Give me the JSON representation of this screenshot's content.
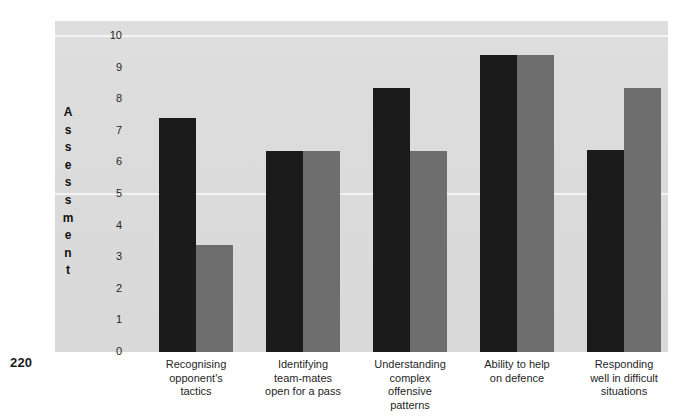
{
  "page": {
    "number": "220"
  },
  "chart_data": {
    "type": "bar",
    "title": "",
    "subtitle": "",
    "xlabel": "",
    "ylabel": "Assessment",
    "ylim": [
      0,
      10
    ],
    "yticks": [
      "10",
      "9",
      "8",
      "7",
      "6",
      "5",
      "4",
      "3",
      "2",
      "1",
      "0"
    ],
    "grid": true,
    "legend_position": "none",
    "categories": [
      "Recognising opponent's tactics",
      "Identifying team-mates open for a pass",
      "Understanding complex offensive patterns",
      "Ability to help on defence",
      "Responding well in difficult situations"
    ],
    "category_lines": [
      [
        "Recognising",
        "opponent's",
        "tactics"
      ],
      [
        "Identifying",
        "team-mates",
        "open for a pass"
      ],
      [
        "Understanding",
        "complex",
        "offensive",
        "patterns"
      ],
      [
        "Ability to help",
        "on defence"
      ],
      [
        "Responding",
        "well in difficult",
        "situations"
      ]
    ],
    "series": [
      {
        "name": "Series 1",
        "color": "#1b1b1b",
        "values": [
          7.4,
          6.35,
          8.35,
          9.4,
          6.4
        ]
      },
      {
        "name": "Series 2",
        "color": "#6e6e6e",
        "values": [
          3.4,
          6.35,
          6.35,
          9.4,
          8.35
        ]
      }
    ],
    "colors": {
      "series_1": "#1b1b1b",
      "series_2": "#6e6e6e",
      "plot_background": "#dcdcdc",
      "gridline": "#f4f4f4",
      "text": "#1f1f1f"
    }
  }
}
